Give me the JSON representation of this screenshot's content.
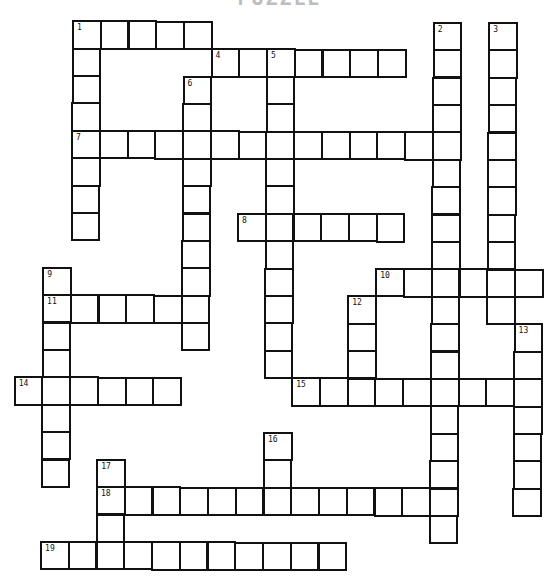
{
  "title": "PUZZLE",
  "puzzle": {
    "grid_rows": 20,
    "grid_cols": 20,
    "words": [
      {
        "number": 1,
        "direction": "across",
        "row": 0,
        "col": 2,
        "length": 5
      },
      {
        "number": 1,
        "direction": "down",
        "row": 0,
        "col": 2,
        "length": 8
      },
      {
        "number": 2,
        "direction": "down",
        "row": 0,
        "col": 15,
        "length": 19
      },
      {
        "number": 3,
        "direction": "down",
        "row": 0,
        "col": 17,
        "length": 11
      },
      {
        "number": 4,
        "direction": "across",
        "row": 1,
        "col": 7,
        "length": 7
      },
      {
        "number": 5,
        "direction": "down",
        "row": 1,
        "col": 9,
        "length": 12
      },
      {
        "number": 6,
        "direction": "down",
        "row": 2,
        "col": 6,
        "length": 10
      },
      {
        "number": 7,
        "direction": "across",
        "row": 4,
        "col": 2,
        "length": 14
      },
      {
        "number": 8,
        "direction": "across",
        "row": 7,
        "col": 8,
        "length": 6
      },
      {
        "number": 9,
        "direction": "down",
        "row": 9,
        "col": 1,
        "length": 8
      },
      {
        "number": 10,
        "direction": "across",
        "row": 9,
        "col": 13,
        "length": 6
      },
      {
        "number": 11,
        "direction": "across",
        "row": 10,
        "col": 1,
        "length": 6
      },
      {
        "number": 12,
        "direction": "down",
        "row": 10,
        "col": 12,
        "length": 4
      },
      {
        "number": 13,
        "direction": "down",
        "row": 11,
        "col": 18,
        "length": 7
      },
      {
        "number": 14,
        "direction": "across",
        "row": 13,
        "col": 0,
        "length": 6
      },
      {
        "number": 15,
        "direction": "across",
        "row": 13,
        "col": 10,
        "length": 9
      },
      {
        "number": 16,
        "direction": "down",
        "row": 15,
        "col": 9,
        "length": 3
      },
      {
        "number": 17,
        "direction": "down",
        "row": 16,
        "col": 3,
        "length": 4
      },
      {
        "number": 18,
        "direction": "across",
        "row": 17,
        "col": 3,
        "length": 13
      },
      {
        "number": 19,
        "direction": "across",
        "row": 19,
        "col": 1,
        "length": 11
      }
    ]
  }
}
